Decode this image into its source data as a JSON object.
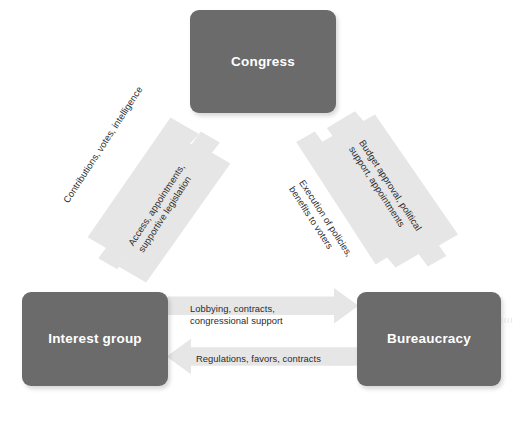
{
  "diagram": {
    "type": "cycle-diagram",
    "background_color": "#ffffff",
    "node_color": "#6b6b6b",
    "node_text_color": "#ffffff",
    "arrow_color": "#e6e6e6",
    "label_text_color": "#2b2b2b",
    "nodes": [
      {
        "id": "congress",
        "label": "Congress"
      },
      {
        "id": "interest",
        "label": "Interest group"
      },
      {
        "id": "bureaucracy",
        "label": "Bureaucracy"
      }
    ],
    "edges": [
      {
        "id": "interest-to-congress",
        "from": "Interest group",
        "to": "Congress",
        "direction": "up-right",
        "label": "Contributions, votes, intelligence"
      },
      {
        "id": "congress-to-interest",
        "from": "Congress",
        "to": "Interest group",
        "direction": "down-left",
        "label_line_1": "Access, appointments,",
        "label_line_2": "supportive legislation"
      },
      {
        "id": "bureaucracy-to-congress",
        "from": "Bureaucracy",
        "to": "Congress",
        "direction": "up-left",
        "label_line_1": "Budget approval, political",
        "label_line_2": "support, appointments"
      },
      {
        "id": "congress-to-bureaucracy",
        "from": "Congress",
        "to": "Bureaucracy",
        "direction": "down-right",
        "label_line_1": "Execution of policies,",
        "label_line_2": "benefits to voters"
      },
      {
        "id": "interest-to-bureaucracy",
        "from": "Interest group",
        "to": "Bureaucracy",
        "direction": "right",
        "label_line_1": "Lobbying, contracts,",
        "label_line_2": "congressional support"
      },
      {
        "id": "bureaucracy-to-interest",
        "from": "Bureaucracy",
        "to": "Interest group",
        "direction": "left",
        "label": "Regulations, favors, contracts"
      }
    ],
    "margin_caption": "( ( ( ("
  }
}
